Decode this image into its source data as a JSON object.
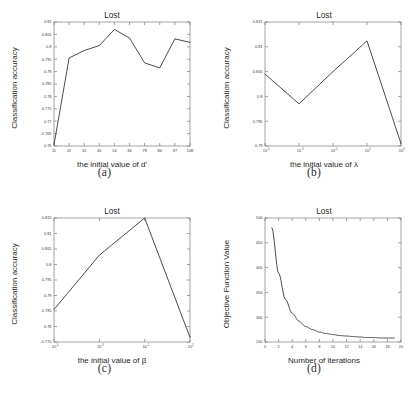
{
  "figure": {
    "panels": [
      {
        "caption": "(a)",
        "title": "Lost",
        "ylabel": "Classification accuracy",
        "xlabel": "the initial value of d'"
      },
      {
        "caption": "(b)",
        "title": "Lost",
        "ylabel": "Classification accuracy",
        "xlabel": "the initial value of λ"
      },
      {
        "caption": "(c)",
        "title": "Lost",
        "ylabel": "Classification accuracy",
        "xlabel": "the initial value of β"
      },
      {
        "caption": "(d)",
        "title": "Lost",
        "ylabel": "Objective Function Value",
        "xlabel": "Number of iterations"
      }
    ]
  },
  "chart_data": [
    {
      "type": "line",
      "panel": "(a)",
      "title": "Lost",
      "xlabel": "the initial value of d'",
      "ylabel": "Classification accuracy",
      "x_tick_labels": [
        "11",
        "22",
        "32",
        "40",
        "54",
        "66",
        "78",
        "86",
        "97",
        "108"
      ],
      "x": [
        11,
        22,
        32,
        40,
        54,
        66,
        78,
        86,
        97,
        108
      ],
      "values": [
        0.7605,
        0.7955,
        0.7985,
        0.8005,
        0.807,
        0.8035,
        0.7935,
        0.7915,
        0.8032,
        0.8018
      ],
      "y_tick_labels": [
        "0.81",
        "0.805",
        "0.8",
        "0.795",
        "0.79",
        "0.785",
        "0.78",
        "0.775",
        "0.77",
        "0.765",
        "0.76"
      ],
      "ylim": [
        0.76,
        0.81
      ],
      "xlim": [
        11,
        108
      ],
      "grid": false,
      "legend": null,
      "xscale": "linear",
      "yscale": "linear"
    },
    {
      "type": "line",
      "panel": "(b)",
      "title": "Lost",
      "xlabel": "the initial value of λ",
      "ylabel": "Classification accuracy",
      "x_tick_labels": [
        "10^-5",
        "10^-3",
        "10^-1",
        "10^1",
        "10^3"
      ],
      "x_exponents": [
        -5,
        -3,
        -1,
        1,
        3
      ],
      "x": [
        1e-05,
        0.001,
        0.1,
        10,
        1000
      ],
      "values": [
        0.8045,
        0.7985,
        0.805,
        0.8112,
        0.7905
      ],
      "y_tick_labels": [
        "0.815",
        "0.81",
        "0.805",
        "0.8",
        "0.795",
        "0.79"
      ],
      "ylim": [
        0.79,
        0.815
      ],
      "grid": false,
      "legend": null,
      "xscale": "log",
      "yscale": "linear"
    },
    {
      "type": "line",
      "panel": "(c)",
      "title": "Lost",
      "xlabel": "the initial value of β",
      "ylabel": "Classification accuracy",
      "x_tick_labels": [
        "10^-5",
        "10^-3",
        "10^-1",
        "10^1"
      ],
      "x_exponents": [
        -5,
        -3,
        -1,
        1
      ],
      "x": [
        1e-05,
        0.001,
        0.1,
        10
      ],
      "values": [
        0.7855,
        0.803,
        0.815,
        0.7765
      ],
      "y_tick_labels": [
        "0.815",
        "0.81",
        "0.805",
        "0.8",
        "0.795",
        "0.79",
        "0.785",
        "0.78",
        "0.775"
      ],
      "ylim": [
        0.775,
        0.815
      ],
      "grid": false,
      "legend": null,
      "xscale": "log",
      "yscale": "linear"
    },
    {
      "type": "line",
      "panel": "(d)",
      "title": "Lost",
      "xlabel": "Number of iterations",
      "ylabel": "Objective Function Value",
      "x_tick_labels": [
        "0",
        "2",
        "4",
        "6",
        "8",
        "10",
        "12",
        "14",
        "16",
        "18",
        "20"
      ],
      "x": [
        1,
        2,
        3,
        4,
        5,
        6,
        7,
        8,
        9,
        10,
        11,
        12,
        13,
        14,
        15,
        16,
        17,
        18,
        19
      ],
      "values": [
        480,
        389,
        336,
        308,
        292,
        281,
        275,
        270,
        267,
        265,
        263,
        262,
        261,
        260,
        259,
        259,
        258,
        258,
        258
      ],
      "y_tick_labels": [
        "500",
        "450",
        "400",
        "350",
        "300",
        "250"
      ],
      "ylim": [
        250,
        500
      ],
      "xlim": [
        0,
        20
      ],
      "grid": false,
      "legend": null,
      "xscale": "linear",
      "yscale": "linear"
    }
  ]
}
